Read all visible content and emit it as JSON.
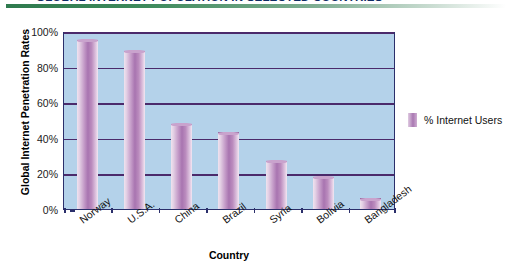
{
  "banner": {
    "title": "GLOBAL INTERNET POPULATION IN SELECTED COUNTRIES",
    "accent_color": "#2f7a4e"
  },
  "legend": {
    "label": "% Internet Users",
    "swatch_color": "#a978b2"
  },
  "chart_data": {
    "type": "bar",
    "title": "GLOBAL INTERNET POPULATION IN SELECTED COUNTRIES",
    "xlabel": "Country",
    "ylabel": "Global Internet Penetration Rates",
    "categories": [
      "Norway",
      "U.S.A.",
      "China",
      "Brazil",
      "Syria",
      "Bolivia",
      "Bangladesh"
    ],
    "values": [
      95,
      89,
      48,
      43,
      27,
      18,
      6
    ],
    "series": [
      {
        "name": "% Internet Users",
        "values": [
          95,
          89,
          48,
          43,
          27,
          18,
          6
        ]
      }
    ],
    "ylim": [
      0,
      100
    ],
    "ytick_labels": [
      "0%",
      "20%",
      "40%",
      "60%",
      "80%",
      "100%"
    ],
    "ytick_values": [
      0,
      20,
      40,
      60,
      80,
      100
    ],
    "grid": true,
    "legend_position": "right",
    "plot_background": "#b4d2ea",
    "bar_color": "#a978b2",
    "axis_color": "#2b2f6b",
    "gridline_color": "#4b2a6b"
  }
}
